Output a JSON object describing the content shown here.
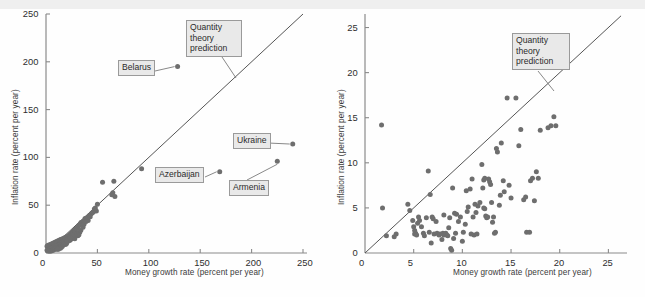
{
  "figure": {
    "background_color": "#fefefe",
    "dot_color": "#6e6e6e",
    "line_color": "#555555",
    "axis_color": "#8a8a8a",
    "callout_fill": "#e9e9e9",
    "callout_border": "#9a9a9a"
  },
  "charts": [
    {
      "id": "left",
      "chart_data": {
        "type": "scatter",
        "title": "",
        "xlabel": "Money growth rate (percent per year)",
        "ylabel": "Inflation rate (percent per year)",
        "xlim": [
          0,
          250
        ],
        "ylim": [
          0,
          250
        ],
        "xticks": [
          0,
          50,
          100,
          150,
          200,
          250
        ],
        "yticks": [
          0,
          50,
          100,
          150,
          200,
          250
        ],
        "xticklabels": [
          "0",
          "50",
          "100",
          "150",
          "200",
          "250"
        ],
        "yticklabels": [
          "0",
          "50",
          "100",
          "150",
          "200",
          "250"
        ],
        "grid": false,
        "legend": "none",
        "reference_line": {
          "label": "Quantity theory prediction",
          "slope": 1,
          "intercept": 0,
          "from": [
            0,
            0
          ],
          "to": [
            250,
            250
          ]
        },
        "annotations": [
          {
            "label": "Belarus",
            "point": [
              128,
              195
            ]
          },
          {
            "label": "Ukraine",
            "point": [
              240,
              114
            ]
          },
          {
            "label": "Azerbaijan",
            "point": [
              169,
              85
            ]
          },
          {
            "label": "Armenia",
            "point": [
              225,
              96
            ]
          },
          {
            "label": "Quantity theory prediction",
            "point": [
              188,
              188
            ]
          }
        ],
        "points": [
          [
            128,
            195
          ],
          [
            240,
            114
          ],
          [
            169,
            85
          ],
          [
            225,
            96
          ],
          [
            93,
            88
          ],
          [
            66,
            75
          ],
          [
            55,
            74
          ],
          [
            65,
            63
          ],
          [
            64,
            61
          ],
          [
            67,
            59
          ],
          [
            50,
            51
          ],
          [
            47,
            46
          ],
          [
            44,
            41
          ],
          [
            42,
            39
          ],
          [
            40,
            37
          ],
          [
            38,
            36
          ],
          [
            36,
            33
          ],
          [
            35,
            31
          ],
          [
            34,
            32
          ],
          [
            33,
            30
          ],
          [
            32,
            29
          ],
          [
            31,
            27
          ],
          [
            30,
            26
          ],
          [
            34,
            24
          ],
          [
            33,
            22
          ],
          [
            31,
            21
          ],
          [
            29,
            25
          ],
          [
            28,
            24
          ],
          [
            27,
            23
          ],
          [
            26,
            22
          ],
          [
            25,
            21
          ],
          [
            24,
            20
          ],
          [
            23,
            19
          ],
          [
            29,
            18
          ],
          [
            22,
            18
          ],
          [
            21,
            17
          ],
          [
            20,
            17
          ],
          [
            19,
            16
          ],
          [
            18,
            16
          ],
          [
            17,
            15
          ],
          [
            16,
            15
          ],
          [
            15,
            14
          ],
          [
            14,
            14
          ],
          [
            13,
            13
          ],
          [
            12,
            13
          ],
          [
            11,
            12
          ],
          [
            10,
            12
          ],
          [
            9,
            11
          ],
          [
            8,
            11
          ],
          [
            7,
            10
          ],
          [
            6,
            10
          ],
          [
            5,
            9
          ],
          [
            4,
            9
          ],
          [
            3,
            8
          ],
          [
            2,
            8
          ],
          [
            1,
            7
          ],
          [
            13,
            9
          ],
          [
            14,
            10
          ],
          [
            15,
            11
          ],
          [
            16,
            12
          ],
          [
            17,
            13
          ],
          [
            18,
            14
          ],
          [
            12,
            8
          ],
          [
            11,
            8
          ],
          [
            10,
            7
          ],
          [
            9,
            7
          ],
          [
            8,
            6
          ],
          [
            7,
            6
          ],
          [
            6,
            5
          ],
          [
            5,
            5
          ],
          [
            4,
            4
          ],
          [
            3,
            4
          ],
          [
            2,
            3
          ],
          [
            1,
            3
          ],
          [
            14,
            7
          ],
          [
            15,
            8
          ],
          [
            16,
            9
          ],
          [
            13,
            6
          ],
          [
            12,
            6
          ],
          [
            11,
            5
          ],
          [
            10,
            5
          ],
          [
            9,
            4
          ],
          [
            8,
            4
          ],
          [
            7,
            3
          ],
          [
            6,
            3
          ],
          [
            5,
            2
          ],
          [
            4,
            2
          ],
          [
            3,
            2
          ],
          [
            2,
            2
          ],
          [
            19,
            12
          ],
          [
            20,
            13
          ],
          [
            21,
            14
          ],
          [
            22,
            15
          ],
          [
            23,
            13
          ],
          [
            24,
            14
          ],
          [
            25,
            15
          ],
          [
            26,
            16
          ],
          [
            27,
            17
          ],
          [
            28,
            15
          ],
          [
            18,
            10
          ],
          [
            19,
            9
          ],
          [
            20,
            10
          ],
          [
            17,
            9
          ],
          [
            16,
            7
          ],
          [
            15,
            6
          ],
          [
            14,
            5
          ],
          [
            13,
            5
          ],
          [
            12,
            4
          ],
          [
            11,
            4
          ],
          [
            36,
            27
          ],
          [
            37,
            30
          ],
          [
            39,
            33
          ],
          [
            41,
            34
          ],
          [
            43,
            38
          ],
          [
            45,
            42
          ],
          [
            48,
            47
          ],
          [
            49,
            44
          ],
          [
            46,
            43
          ],
          [
            30,
            20
          ],
          [
            31,
            18
          ],
          [
            32,
            19
          ],
          [
            28,
            19
          ],
          [
            26,
            18
          ],
          [
            24,
            16
          ],
          [
            22,
            13
          ],
          [
            21,
            12
          ],
          [
            23,
            15
          ]
        ]
      }
    },
    {
      "id": "right",
      "chart_data": {
        "type": "scatter",
        "title": "",
        "xlabel": "Money growth rate (percent per year)",
        "ylabel": "Inflation rate (percent per year)",
        "xlim": [
          0,
          26.5
        ],
        "ylim": [
          0,
          26.5
        ],
        "xticks": [
          0,
          5,
          10,
          15,
          20,
          25
        ],
        "yticks": [
          0,
          5,
          10,
          15,
          20,
          25
        ],
        "xticklabels": [
          "0",
          "5",
          "10",
          "15",
          "20",
          "25"
        ],
        "yticklabels": [
          "0",
          "5",
          "10",
          "15",
          "20",
          "25"
        ],
        "grid": false,
        "legend": "none",
        "reference_line": {
          "label": "Quantity theory prediction",
          "slope": 1,
          "intercept": 0,
          "from": [
            0,
            0
          ],
          "to": [
            26.3,
            26.3
          ]
        },
        "annotations": [
          {
            "label": "Quantity theory prediction",
            "point": [
              19.4,
              19.4
            ]
          }
        ],
        "points": [
          [
            1.7,
            14.2
          ],
          [
            1.8,
            5.0
          ],
          [
            2.2,
            1.9
          ],
          [
            3.0,
            1.8
          ],
          [
            3.2,
            2.1
          ],
          [
            4.4,
            5.4
          ],
          [
            4.6,
            4.7
          ],
          [
            4.9,
            3.6
          ],
          [
            5.0,
            2.9
          ],
          [
            5.1,
            2.1
          ],
          [
            5.2,
            2.2
          ],
          [
            5.3,
            2.0
          ],
          [
            5.1,
            2.5
          ],
          [
            5.4,
            3.3
          ],
          [
            5.6,
            3.6
          ],
          [
            5.8,
            2.9
          ],
          [
            6.0,
            2.2
          ],
          [
            6.1,
            1.9
          ],
          [
            6.3,
            3.9
          ],
          [
            6.5,
            9.1
          ],
          [
            6.6,
            2.3
          ],
          [
            6.7,
            6.5
          ],
          [
            6.8,
            1.1
          ],
          [
            7.0,
            3.8
          ],
          [
            7.1,
            2.1
          ],
          [
            7.3,
            3.5
          ],
          [
            7.4,
            2.2
          ],
          [
            7.6,
            2.0
          ],
          [
            7.7,
            2.1
          ],
          [
            7.9,
            1.5
          ],
          [
            8.0,
            2.2
          ],
          [
            8.1,
            2.0
          ],
          [
            8.2,
            2.1
          ],
          [
            8.3,
            2.2
          ],
          [
            8.4,
            2.0
          ],
          [
            8.5,
            1.9
          ],
          [
            8.6,
            2.8
          ],
          [
            8.7,
            3.9
          ],
          [
            8.8,
            0.5
          ],
          [
            8.9,
            0.3
          ],
          [
            9.0,
            7.2
          ],
          [
            9.1,
            1.6
          ],
          [
            9.3,
            2.2
          ],
          [
            9.4,
            4.3
          ],
          [
            9.6,
            3.5
          ],
          [
            9.8,
            4.0
          ],
          [
            10.0,
            1.3
          ],
          [
            10.1,
            2.3
          ],
          [
            10.3,
            3.2
          ],
          [
            10.4,
            6.9
          ],
          [
            10.5,
            4.6
          ],
          [
            10.6,
            5.1
          ],
          [
            10.8,
            7.1
          ],
          [
            11.0,
            8.2
          ],
          [
            11.1,
            4.0
          ],
          [
            11.2,
            2.0
          ],
          [
            11.3,
            5.4
          ],
          [
            11.4,
            4.5
          ],
          [
            11.6,
            5.2
          ],
          [
            11.8,
            5.6
          ],
          [
            12.0,
            9.8
          ],
          [
            12.1,
            7.2
          ],
          [
            12.2,
            5.0
          ],
          [
            12.3,
            4.9
          ],
          [
            12.4,
            4.1
          ],
          [
            12.5,
            3.9
          ],
          [
            12.6,
            4.0
          ],
          [
            12.7,
            8.2
          ],
          [
            12.8,
            7.9
          ],
          [
            12.9,
            7.6
          ],
          [
            13.0,
            5.6
          ],
          [
            13.1,
            3.4
          ],
          [
            13.2,
            4.0
          ],
          [
            13.3,
            2.2
          ],
          [
            13.4,
            2.3
          ],
          [
            13.5,
            11.6
          ],
          [
            13.6,
            11.2
          ],
          [
            13.8,
            5.3
          ],
          [
            13.9,
            6.4
          ],
          [
            14.0,
            12.2
          ],
          [
            14.2,
            8.0
          ],
          [
            14.3,
            6.8
          ],
          [
            14.6,
            17.2
          ],
          [
            14.8,
            7.5
          ],
          [
            15.0,
            6.1
          ],
          [
            15.5,
            17.2
          ],
          [
            15.8,
            11.9
          ],
          [
            16.0,
            13.7
          ],
          [
            16.3,
            5.9
          ],
          [
            16.5,
            6.2
          ],
          [
            16.6,
            2.3
          ],
          [
            16.9,
            2.3
          ],
          [
            17.0,
            8.0
          ],
          [
            17.2,
            8.3
          ],
          [
            17.4,
            5.8
          ],
          [
            17.6,
            9.0
          ],
          [
            17.8,
            8.3
          ],
          [
            18.0,
            13.6
          ],
          [
            18.8,
            13.9
          ],
          [
            19.1,
            14.1
          ],
          [
            19.4,
            15.1
          ],
          [
            19.6,
            14.1
          ],
          [
            12.2,
            8.1
          ],
          [
            12.3,
            8.3
          ],
          [
            11.5,
            2.1
          ],
          [
            10.9,
            2.1
          ],
          [
            9.2,
            4.4
          ],
          [
            8.1,
            4.2
          ],
          [
            6.9,
            4.0
          ],
          [
            5.5,
            4.0
          ]
        ]
      }
    }
  ]
}
